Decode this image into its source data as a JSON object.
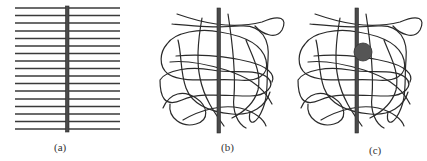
{
  "figure": {
    "panels": [
      {
        "id": "a",
        "label": "(a)",
        "description": "Parallel aligned polymer chains with rod perpendicular"
      },
      {
        "id": "b",
        "label": "(b)",
        "description": "Randomly entangled polymer chains around rod"
      },
      {
        "id": "c",
        "label": "(c)",
        "description": "Entangled polymer chains around rod with attached particle"
      }
    ]
  },
  "colors": {
    "line": "#3a3a3a",
    "rod": "#4a4a4a",
    "ball": "#555555",
    "background": "#ffffff"
  }
}
